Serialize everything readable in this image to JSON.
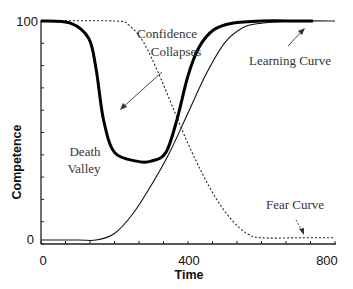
{
  "chart_data": {
    "type": "line",
    "title": "",
    "xlabel": "Time",
    "ylabel": "Competence",
    "xlim": [
      0,
      800
    ],
    "ylim": [
      0,
      100
    ],
    "x_tick_labels": [
      "0",
      "400",
      "800"
    ],
    "y_tick_labels": [
      "0",
      "100"
    ],
    "grid": false,
    "legend": "none (inline annotations)",
    "series": [
      {
        "name": "Confidence (thick)",
        "style": "thick solid",
        "x": [
          0,
          80,
          130,
          150,
          170,
          200,
          260,
          300,
          340,
          370,
          400,
          430,
          470,
          520,
          600,
          700,
          740
        ],
        "values": [
          100,
          99,
          92,
          78,
          55,
          40,
          36,
          36,
          40,
          55,
          75,
          88,
          96,
          99,
          100,
          100,
          100
        ]
      },
      {
        "name": "Learning Curve",
        "style": "thin solid",
        "x": [
          0,
          100,
          150,
          200,
          250,
          300,
          350,
          400,
          450,
          500,
          550,
          600,
          700,
          800
        ],
        "values": [
          0,
          0,
          0,
          3,
          12,
          25,
          40,
          58,
          76,
          90,
          97,
          99,
          100,
          100
        ]
      },
      {
        "name": "Fear Curve",
        "style": "dotted",
        "x": [
          0,
          200,
          240,
          280,
          320,
          360,
          400,
          440,
          480,
          520,
          560,
          600,
          700,
          800
        ],
        "values": [
          100,
          100,
          98,
          90,
          76,
          60,
          44,
          30,
          18,
          9,
          3,
          1,
          1,
          1
        ]
      }
    ],
    "annotations": [
      {
        "text_lines": [
          "Confidence",
          "Collapses"
        ],
        "arrow": true
      },
      {
        "text_lines": [
          "Learning Curve"
        ],
        "arrow": true
      },
      {
        "text_lines": [
          "Death",
          "Valley"
        ],
        "arrow": false
      },
      {
        "text_lines": [
          "Fear Curve"
        ],
        "arrow": true
      }
    ]
  },
  "labels": {
    "x0": "0",
    "x400": "400",
    "x800": "800",
    "y0": "0",
    "y100": "100",
    "xlabel": "Time",
    "ylabel": "Competence",
    "confidence_l1": "Confidence",
    "confidence_l2": "Collapses",
    "learning": "Learning Curve",
    "death_l1": "Death",
    "death_l2": "Valley",
    "fear": "Fear Curve"
  }
}
